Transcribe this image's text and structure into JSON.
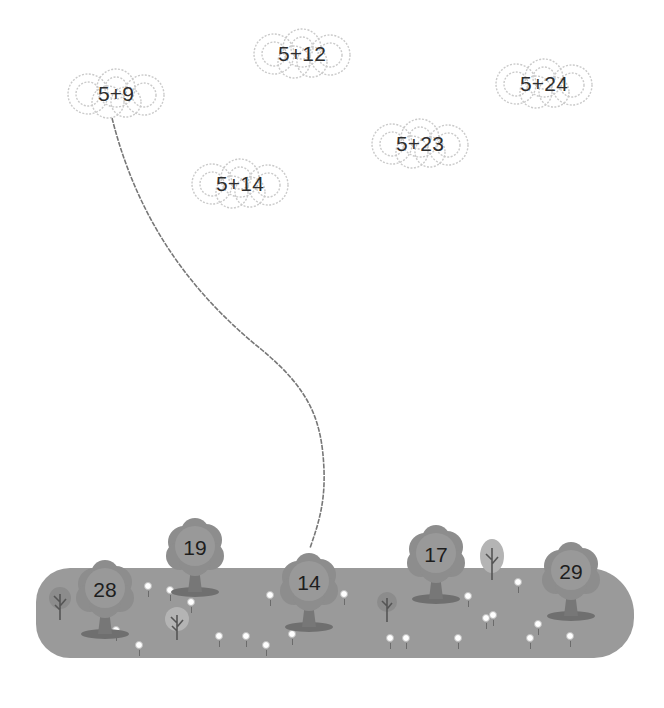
{
  "puzzle": {
    "type": "match addition expressions (clouds) to sums (trees)",
    "colors": {
      "cloud_outline": "#c8c8c8",
      "meadow": "#9a9a9a",
      "tree_crown": "#8a8a8a",
      "tree_trunk": "#6e6e6e",
      "text": "#2e2e2e",
      "connector_line": "#777777"
    }
  },
  "clouds": [
    {
      "id": "cloud-1",
      "expression": "5+9",
      "x": 62,
      "y": 68
    },
    {
      "id": "cloud-2",
      "expression": "5+12",
      "x": 248,
      "y": 28
    },
    {
      "id": "cloud-3",
      "expression": "5+24",
      "x": 490,
      "y": 58
    },
    {
      "id": "cloud-4",
      "expression": "5+23",
      "x": 366,
      "y": 118
    },
    {
      "id": "cloud-5",
      "expression": "5+14",
      "x": 186,
      "y": 158
    }
  ],
  "trees": [
    {
      "id": "tree-28",
      "value": "28",
      "x": 74,
      "y": 560
    },
    {
      "id": "tree-19",
      "value": "19",
      "x": 164,
      "y": 518
    },
    {
      "id": "tree-14",
      "value": "14",
      "x": 278,
      "y": 553
    },
    {
      "id": "tree-17",
      "value": "17",
      "x": 405,
      "y": 525
    },
    {
      "id": "tree-29",
      "value": "29",
      "x": 540,
      "y": 542
    }
  ],
  "connections": [
    {
      "from": "5+9",
      "to": "14"
    }
  ]
}
